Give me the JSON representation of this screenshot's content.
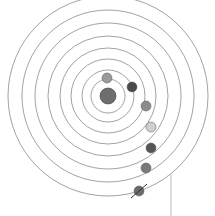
{
  "illustration": {
    "subject": "geocentric solar system sketch",
    "background_color": "#ffffff",
    "orbit_color": "#8a8a8a",
    "center": {
      "x": 108,
      "y": 96
    },
    "central_body": {
      "name": "earth",
      "r": 8,
      "color": "#6e6e6e"
    },
    "orbits": [
      17,
      26,
      37,
      48,
      60,
      73,
      86,
      100
    ],
    "planets": [
      {
        "name": "moon",
        "x": 107,
        "y": 78,
        "r": 5,
        "color": "#9a9a9a"
      },
      {
        "name": "mercury",
        "x": 132,
        "y": 87,
        "r": 5,
        "color": "#4a4a4a"
      },
      {
        "name": "venus",
        "x": 146,
        "y": 106,
        "r": 5,
        "color": "#8c8c8c"
      },
      {
        "name": "sun",
        "x": 151,
        "y": 127,
        "r": 5,
        "color": "#cfcfcf"
      },
      {
        "name": "mars",
        "x": 151,
        "y": 148,
        "r": 5,
        "color": "#555555"
      },
      {
        "name": "jupiter",
        "x": 146,
        "y": 168,
        "r": 5,
        "color": "#7a7a7a"
      },
      {
        "name": "saturn",
        "x": 139,
        "y": 191,
        "r": 5,
        "color": "#6a6a6a",
        "ring": true
      }
    ],
    "pointer_line": {
      "x": 171,
      "y1": 174,
      "y2": 216,
      "color": "#bdbdbd"
    }
  }
}
